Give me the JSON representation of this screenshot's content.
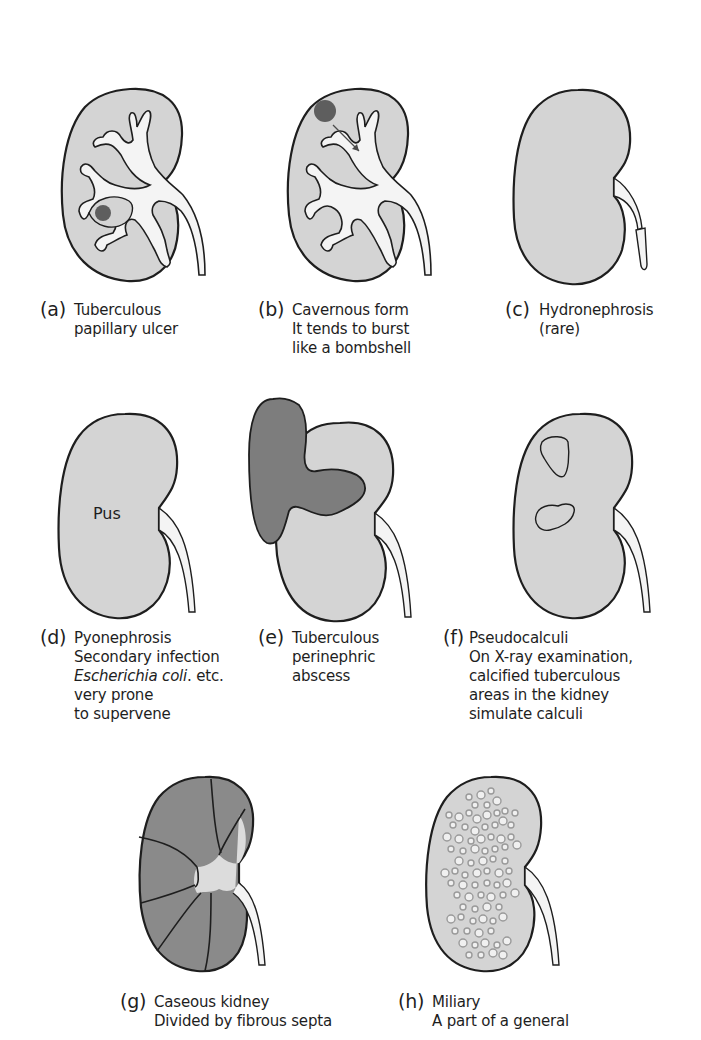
{
  "colors": {
    "kidney_fill": "#d4d4d4",
    "outline": "#1e1e1e",
    "lesion_dark": "#5e5e5e",
    "abscess_fill": "#7d7d7d",
    "caseous_fill": "#8a8a8a",
    "pelvis_fill": "#f4f4f4",
    "background": "#ffffff"
  },
  "panels": [
    {
      "id": "a",
      "letter": "(a)",
      "lines": [
        "Tuberculous",
        "papillary ulcer"
      ]
    },
    {
      "id": "b",
      "letter": "(b)",
      "lines": [
        "Cavernous form",
        "It tends to burst",
        "like a bombshell"
      ]
    },
    {
      "id": "c",
      "letter": "(c)",
      "lines": [
        "Hydronephrosis",
        "(rare)"
      ]
    },
    {
      "id": "d",
      "letter": "(d)",
      "lines": [
        "Pyonephrosis",
        "Secondary infection",
        "Escherichia coli. etc.",
        "very prone",
        "to supervene"
      ],
      "inner_label": "Pus",
      "italic_part": "Escherichia coli",
      "italic_rest": ". etc."
    },
    {
      "id": "e",
      "letter": "(e)",
      "lines": [
        "Tuberculous",
        "perinephric",
        "abscess"
      ]
    },
    {
      "id": "f",
      "letter": "(f)",
      "lines": [
        "Pseudocalculi",
        "On X-ray examination,",
        "calcified tuberculous",
        "areas in the kidney",
        "simulate calculi"
      ]
    },
    {
      "id": "g",
      "letter": "(g)",
      "lines": [
        "Caseous kidney",
        "Divided by fibrous septa"
      ]
    },
    {
      "id": "h",
      "letter": "(h)",
      "lines": [
        "Miliary",
        "A part of a general"
      ]
    }
  ]
}
